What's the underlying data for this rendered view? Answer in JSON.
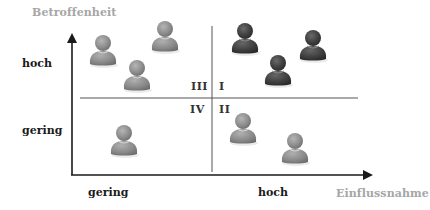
{
  "diagram": {
    "y_axis": {
      "title": "Betroffenheit",
      "tick_high": "hoch",
      "tick_low": "gering"
    },
    "x_axis": {
      "title": "Einflussnahme",
      "tick_low": "gering",
      "tick_high": "hoch"
    },
    "quadrants": {
      "top_left": "III",
      "top_right": "I",
      "bottom_left": "IV",
      "bottom_right": "II"
    },
    "colors": {
      "axis": "#1a1a1a",
      "divider": "#555555",
      "axis_title": "#a6a6a6",
      "person_light": "#8c8c8c",
      "person_dark": "#3d3d3d"
    },
    "persons": [
      {
        "quadrant": "III",
        "x": 103,
        "y": 52,
        "tone": "light",
        "icon": "person-icon"
      },
      {
        "quadrant": "III",
        "x": 165,
        "y": 38,
        "tone": "light",
        "icon": "person-icon"
      },
      {
        "quadrant": "III",
        "x": 137,
        "y": 77,
        "tone": "light",
        "icon": "person-icon"
      },
      {
        "quadrant": "I",
        "x": 245,
        "y": 40,
        "tone": "dark",
        "icon": "person-icon"
      },
      {
        "quadrant": "I",
        "x": 313,
        "y": 47,
        "tone": "dark",
        "icon": "person-icon"
      },
      {
        "quadrant": "I",
        "x": 278,
        "y": 72,
        "tone": "dark",
        "icon": "person-icon"
      },
      {
        "quadrant": "IV",
        "x": 124,
        "y": 142,
        "tone": "light",
        "icon": "person-icon"
      },
      {
        "quadrant": "II",
        "x": 243,
        "y": 130,
        "tone": "light",
        "icon": "person-icon"
      },
      {
        "quadrant": "II",
        "x": 295,
        "y": 150,
        "tone": "light",
        "icon": "person-icon"
      }
    ]
  }
}
